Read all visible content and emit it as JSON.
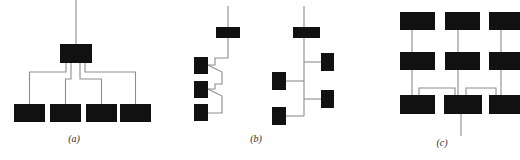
{
  "figure": {
    "width": 520,
    "height": 160,
    "background_color": "#ffffff",
    "node_color": "#111111",
    "edge_color": "#8d8d8d",
    "caption_color": "#2b2b2b",
    "panels": [
      {
        "id": "a",
        "caption": "(a)",
        "caption_x": 74,
        "caption_y": 142,
        "description": "star / broadcast topology: one central node fanning out to four leaf nodes",
        "nodes": [
          {
            "name": "root",
            "x": 60,
            "y": 44,
            "w": 32,
            "h": 19
          },
          {
            "name": "leaf-1",
            "x": 14,
            "y": 104,
            "w": 31,
            "h": 18
          },
          {
            "name": "leaf-2",
            "x": 50,
            "y": 104,
            "w": 31,
            "h": 18
          },
          {
            "name": "leaf-3",
            "x": 86,
            "y": 104,
            "w": 31,
            "h": 18
          },
          {
            "name": "leaf-4",
            "x": 120,
            "y": 104,
            "w": 31,
            "h": 18
          }
        ],
        "edges": [
          {
            "name": "uplink",
            "d": "M 76,0 L 76,44"
          },
          {
            "name": "root-leaf-1",
            "d": "M 66,63 L 66,72 L 29.5,72 L 29.5,104"
          },
          {
            "name": "root-leaf-2",
            "d": "M 71,63 L 71,79 L 65.5,79 L 65.5,104"
          },
          {
            "name": "root-leaf-3",
            "d": "M 80,63 L 80,79 L 101.5,79 L 101.5,104"
          },
          {
            "name": "root-leaf-4",
            "d": "M 85,63 L 85,72 L 135.5,72 L 135.5,104"
          }
        ]
      },
      {
        "id": "b",
        "caption": "(b)",
        "caption_x": 256,
        "caption_y": 142,
        "description": "two daisy-chain / bus variants: left zig-zag cascade, right vertical bus with alternating taps",
        "nodes": [
          {
            "name": "left-head",
            "x": 216,
            "y": 27,
            "w": 24,
            "h": 11
          },
          {
            "name": "left-tap-1",
            "x": 194,
            "y": 57,
            "w": 14,
            "h": 17
          },
          {
            "name": "left-tap-2",
            "x": 194,
            "y": 81,
            "w": 14,
            "h": 17
          },
          {
            "name": "left-tap-3",
            "x": 194,
            "y": 104,
            "w": 14,
            "h": 17
          },
          {
            "name": "right-head",
            "x": 293,
            "y": 27,
            "w": 27,
            "h": 11
          },
          {
            "name": "right-tap-1",
            "x": 321,
            "y": 53,
            "w": 13,
            "h": 18
          },
          {
            "name": "right-tap-2",
            "x": 272,
            "y": 72,
            "w": 14,
            "h": 18
          },
          {
            "name": "right-tap-3",
            "x": 321,
            "y": 90,
            "w": 13,
            "h": 18
          },
          {
            "name": "right-tap-4",
            "x": 272,
            "y": 107,
            "w": 14,
            "h": 18
          }
        ],
        "edges": [
          {
            "name": "left-uplink",
            "d": "M 228,6 L 228,27"
          },
          {
            "name": "left-spine-1",
            "d": "M 228,38 L 228,58 L 215,58 L 215,65 L 208,65"
          },
          {
            "name": "left-spine-2",
            "d": "M 208,65 L 222,72 L 222,84 L 215,84 L 215,89 L 208,89"
          },
          {
            "name": "left-spine-3",
            "d": "M 208,89 L 222,96 L 222,113 L 208,113"
          },
          {
            "name": "right-uplink",
            "d": "M 304,6 L 304,27"
          },
          {
            "name": "right-spine",
            "d": "M 304,38 L 304,116"
          },
          {
            "name": "right-tap-1-link",
            "d": "M 304,62 L 321,62"
          },
          {
            "name": "right-tap-2-link",
            "d": "M 286,81 L 304,81"
          },
          {
            "name": "right-tap-3-link",
            "d": "M 304,99 L 321,99"
          },
          {
            "name": "right-tap-4-link",
            "d": "M 286,116 L 304,116"
          }
        ]
      },
      {
        "id": "c",
        "caption": "(c)",
        "caption_x": 442,
        "caption_y": 146,
        "description": "hierarchical tree of trees: three vertical chains joined at their bottom row through a central node with a downlink",
        "nodes": [
          {
            "name": "col-1-top",
            "x": 400,
            "y": 12,
            "w": 35,
            "h": 18
          },
          {
            "name": "col-2-top",
            "x": 445,
            "y": 12,
            "w": 35,
            "h": 18
          },
          {
            "name": "col-3-top",
            "x": 489,
            "y": 12,
            "w": 31,
            "h": 18
          },
          {
            "name": "col-1-mid",
            "x": 400,
            "y": 52,
            "w": 35,
            "h": 18
          },
          {
            "name": "col-2-mid",
            "x": 445,
            "y": 52,
            "w": 35,
            "h": 18
          },
          {
            "name": "col-3-mid",
            "x": 489,
            "y": 52,
            "w": 31,
            "h": 18
          },
          {
            "name": "col-1-bottom",
            "x": 400,
            "y": 95,
            "w": 35,
            "h": 19
          },
          {
            "name": "col-2-bottom",
            "x": 444,
            "y": 95,
            "w": 38,
            "h": 19
          },
          {
            "name": "col-3-bottom",
            "x": 489,
            "y": 95,
            "w": 31,
            "h": 19
          }
        ],
        "edges": [
          {
            "name": "col-1-top-mid",
            "d": "M 412,30 L 412,52"
          },
          {
            "name": "col-2-top-mid",
            "d": "M 458,30 L 458,52"
          },
          {
            "name": "col-3-top-mid",
            "d": "M 501,30 L 501,52"
          },
          {
            "name": "col-1-mid-bottom",
            "d": "M 412,70 L 412,95"
          },
          {
            "name": "col-2-mid-bottom",
            "d": "M 458,70 L 458,95"
          },
          {
            "name": "col-3-mid-bottom",
            "d": "M 501,70 L 501,95"
          },
          {
            "name": "bottom-link-left",
            "d": "M 419,95 L 419,88 L 455,88 L 455,95"
          },
          {
            "name": "bottom-link-right",
            "d": "M 466,95 L 466,88 L 496,88 L 496,95"
          },
          {
            "name": "downlink",
            "d": "M 461,114 L 461,136"
          }
        ]
      }
    ]
  }
}
